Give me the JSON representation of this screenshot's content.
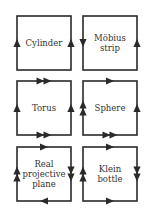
{
  "diagram": {
    "stroke_color": "#2a2a2a",
    "label_color": "#333333",
    "surfaces": [
      {
        "name": "cylinder",
        "label": "Cylinder",
        "x": 17,
        "y": 16,
        "edges": {
          "top": [],
          "bottom": [],
          "left": [
            "up"
          ],
          "right": [
            "up"
          ]
        }
      },
      {
        "name": "mobius-strip",
        "label": "Möbius\nstrip",
        "x": 83,
        "y": 16,
        "edges": {
          "top": [],
          "bottom": [],
          "left": [
            "down"
          ],
          "right": [
            "up"
          ]
        }
      },
      {
        "name": "torus",
        "label": "Torus",
        "x": 17,
        "y": 81,
        "edges": {
          "top": [
            "right",
            "right"
          ],
          "bottom": [
            "right",
            "right"
          ],
          "left": [
            "up"
          ],
          "right": [
            "up"
          ]
        }
      },
      {
        "name": "sphere",
        "label": "Sphere",
        "x": 83,
        "y": 81,
        "edges": {
          "top": [
            "right"
          ],
          "bottom": [
            "right",
            "right"
          ],
          "left": [
            "up",
            "up"
          ],
          "right": [
            "up"
          ]
        }
      },
      {
        "name": "real-projective-plane",
        "label": "Real\nprojective\nplane",
        "x": 17,
        "y": 147,
        "edges": {
          "top": [
            "right"
          ],
          "bottom": [
            "left"
          ],
          "left": [
            "up",
            "up"
          ],
          "right": [
            "down",
            "down"
          ]
        }
      },
      {
        "name": "klein-bottle",
        "label": "Klein\nbottle",
        "x": 83,
        "y": 147,
        "edges": {
          "top": [
            "right"
          ],
          "bottom": [
            "right"
          ],
          "left": [
            "up",
            "up"
          ],
          "right": [
            "down",
            "down"
          ]
        }
      }
    ]
  }
}
